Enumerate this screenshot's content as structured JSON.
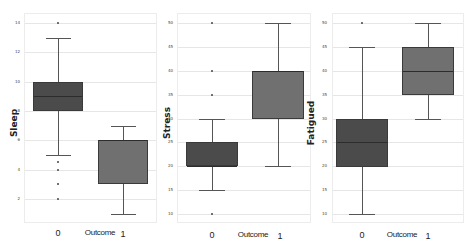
{
  "chart_data": [
    {
      "type": "box",
      "title": "",
      "xlabel": "Outcome",
      "ylabel": "Sleep",
      "categories": [
        "0",
        "1"
      ],
      "yticks": [
        2,
        4,
        6,
        8,
        10,
        12,
        14
      ],
      "ylim": [
        0,
        15
      ],
      "grid": true,
      "series": [
        {
          "category": "0",
          "whisker_low": 5,
          "q1": 8,
          "median": 9,
          "q3": 10,
          "whisker_high": 13,
          "outliers": [
            14,
            4.5,
            4,
            3,
            2
          ],
          "color": "#4b4b4b"
        },
        {
          "category": "1",
          "whisker_low": 1,
          "q1": 3,
          "median": 6,
          "q3": 6,
          "whisker_high": 7,
          "outliers": [],
          "color": "#707070"
        }
      ]
    },
    {
      "type": "box",
      "title": "",
      "xlabel": "Outcome",
      "ylabel": "Stress",
      "categories": [
        "0",
        "1"
      ],
      "yticks": [
        10,
        15,
        20,
        25,
        30,
        35,
        40,
        45,
        50
      ],
      "ylim": [
        8,
        52
      ],
      "grid": true,
      "series": [
        {
          "category": "0",
          "whisker_low": 15,
          "q1": 20,
          "median": 20,
          "q3": 25,
          "whisker_high": 30,
          "outliers": [
            50,
            40,
            35,
            10
          ],
          "color": "#4b4b4b"
        },
        {
          "category": "1",
          "whisker_low": 20,
          "q1": 30,
          "median": 40,
          "q3": 40,
          "whisker_high": 50,
          "outliers": [],
          "color": "#707070"
        }
      ]
    },
    {
      "type": "box",
      "title": "",
      "xlabel": "Outcome",
      "ylabel": "Fatigued",
      "categories": [
        "0",
        "1"
      ],
      "yticks": [
        10,
        15,
        20,
        25,
        30,
        35,
        40,
        45,
        50
      ],
      "ylim": [
        8,
        52
      ],
      "grid": true,
      "series": [
        {
          "category": "0",
          "whisker_low": 10,
          "q1": 20,
          "median": 25,
          "q3": 30,
          "whisker_high": 45,
          "outliers": [
            50
          ],
          "color": "#4b4b4b"
        },
        {
          "category": "1",
          "whisker_low": 30,
          "q1": 35,
          "median": 40,
          "q3": 45,
          "whisker_high": 50,
          "outliers": [],
          "color": "#707070"
        }
      ]
    }
  ],
  "panels": [
    {
      "ylabel": "Sleep",
      "xlabel": "Outcome",
      "x0": "0",
      "x1": "1",
      "ticks": [
        "14",
        "12",
        "10",
        "8",
        "6",
        "4",
        "2"
      ]
    },
    {
      "ylabel": "Stress",
      "xlabel": "Outcome",
      "x0": "0",
      "x1": "1",
      "ticks": [
        "50",
        "45",
        "40",
        "35",
        "30",
        "25",
        "20",
        "15",
        "10"
      ]
    },
    {
      "ylabel": "Fatigued",
      "xlabel": "Outcome",
      "x0": "0",
      "x1": "1",
      "ticks": [
        "50",
        "45",
        "40",
        "35",
        "30",
        "25",
        "20",
        "15",
        "10"
      ]
    }
  ]
}
